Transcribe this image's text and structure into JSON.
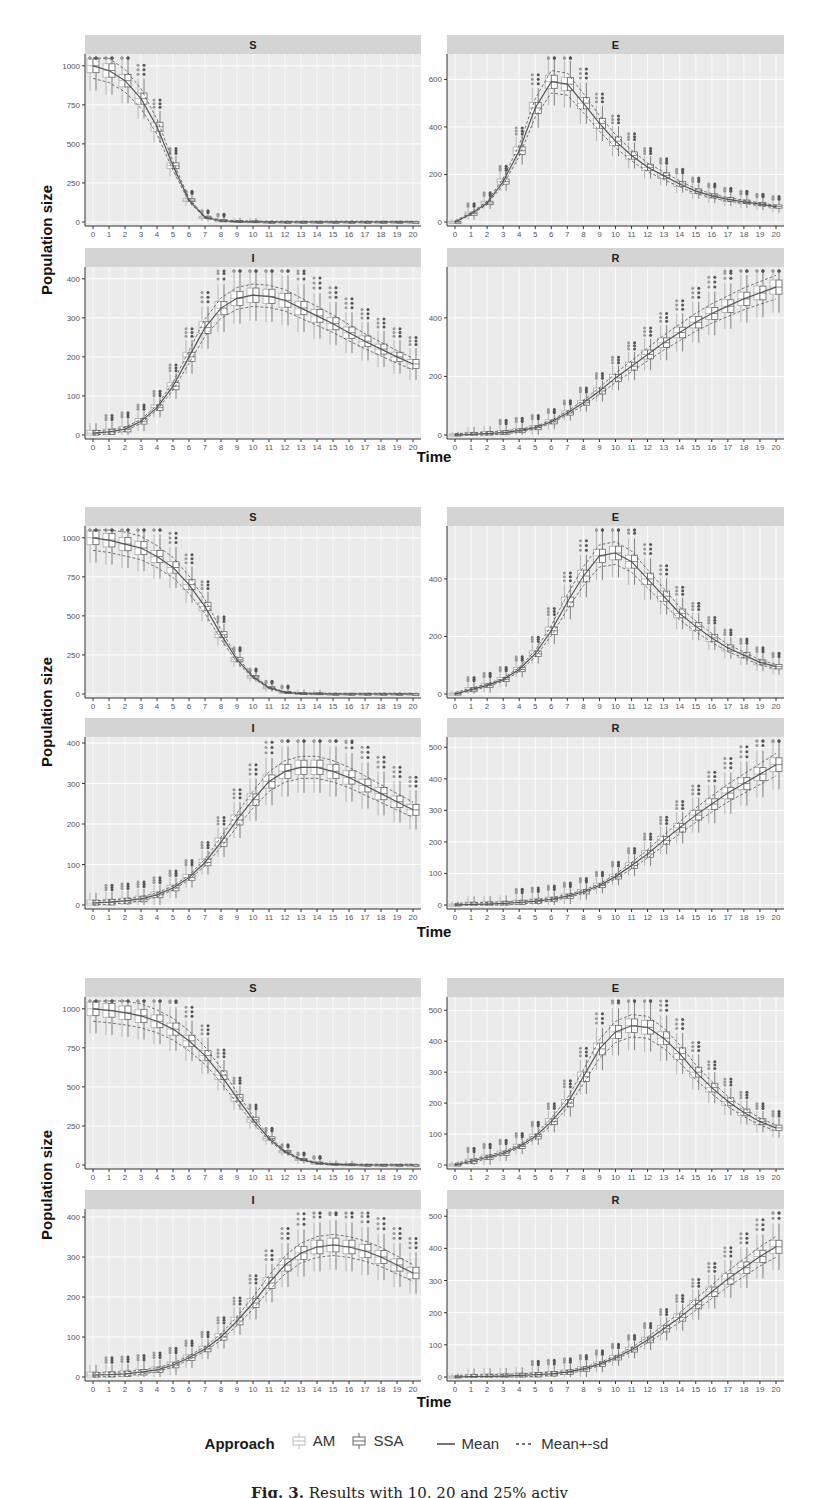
{
  "figure": {
    "y_axis_label": "Population size",
    "x_axis_label": "Time",
    "x_ticks": [
      "0",
      "1",
      "2",
      "3",
      "4",
      "5",
      "6",
      "7",
      "8",
      "9",
      "10",
      "11",
      "12",
      "13",
      "14",
      "15",
      "16",
      "17",
      "18",
      "19",
      "20"
    ]
  },
  "legend": {
    "title": "Approach",
    "items": [
      {
        "label": "AM",
        "symbol": "box-light"
      },
      {
        "label": "SSA",
        "symbol": "box-dark"
      },
      {
        "label": "Mean",
        "symbol": "solid-line"
      },
      {
        "label": "Mean+-sd",
        "symbol": "dashed-line"
      }
    ]
  },
  "caption": {
    "prefix": "Fig. 3.",
    "text": "Results with 10, 20 and 25% activ"
  },
  "colors": {
    "panel_bg": "#ebebeb",
    "strip_bg": "#d4d4d4",
    "grid": "#ffffff",
    "line": "#555555",
    "outlier_am": "#9a9a9a",
    "outlier_ssa": "#555555"
  },
  "chart_data": [
    {
      "type": "box",
      "block": 1,
      "title": "S",
      "xlabel": "Time",
      "ylabel": "Population size",
      "ylim": [
        0,
        1050
      ],
      "yticks": [
        0,
        250,
        500,
        750,
        1000
      ],
      "x": [
        0,
        1,
        2,
        3,
        4,
        5,
        6,
        7,
        8,
        9,
        10,
        11,
        12,
        13,
        14,
        15,
        16,
        17,
        18,
        19,
        20
      ],
      "series": [
        {
          "name": "Mean",
          "values": [
            1000,
            970,
            905,
            790,
            610,
            360,
            140,
            30,
            8,
            3,
            1,
            0,
            0,
            0,
            0,
            0,
            0,
            0,
            0,
            0,
            0
          ]
        }
      ]
    },
    {
      "type": "box",
      "block": 1,
      "title": "E",
      "ylim": [
        0,
        690
      ],
      "yticks": [
        0,
        200,
        400,
        600
      ],
      "x": [
        0,
        1,
        2,
        3,
        4,
        5,
        6,
        7,
        8,
        9,
        10,
        11,
        12,
        13,
        14,
        15,
        16,
        17,
        18,
        19,
        20
      ],
      "series": [
        {
          "name": "Mean",
          "values": [
            0,
            35,
            80,
            170,
            300,
            480,
            590,
            580,
            500,
            415,
            340,
            280,
            230,
            195,
            160,
            130,
            110,
            95,
            85,
            75,
            65
          ]
        }
      ]
    },
    {
      "type": "box",
      "block": 1,
      "title": "I",
      "ylim": [
        0,
        420
      ],
      "yticks": [
        0,
        100,
        200,
        300,
        400
      ],
      "x": [
        0,
        1,
        2,
        3,
        4,
        5,
        6,
        7,
        8,
        9,
        10,
        11,
        12,
        13,
        14,
        15,
        16,
        17,
        18,
        19,
        20
      ],
      "series": [
        {
          "name": "Mean",
          "values": [
            5,
            8,
            15,
            35,
            70,
            125,
            200,
            275,
            325,
            350,
            358,
            355,
            345,
            325,
            305,
            285,
            262,
            240,
            220,
            200,
            182
          ]
        }
      ]
    },
    {
      "type": "box",
      "block": 1,
      "title": "R",
      "ylim": [
        0,
        560
      ],
      "yticks": [
        0,
        200,
        400
      ],
      "x": [
        0,
        1,
        2,
        3,
        4,
        5,
        6,
        7,
        8,
        9,
        10,
        11,
        12,
        13,
        14,
        15,
        16,
        17,
        18,
        19,
        20
      ],
      "series": [
        {
          "name": "Mean",
          "values": [
            0,
            2,
            5,
            8,
            15,
            25,
            45,
            75,
            110,
            150,
            195,
            235,
            275,
            315,
            350,
            385,
            415,
            440,
            465,
            485,
            505
          ]
        }
      ]
    },
    {
      "type": "box",
      "block": 2,
      "title": "S",
      "ylim": [
        0,
        1050
      ],
      "yticks": [
        0,
        250,
        500,
        750,
        1000
      ],
      "x": [
        0,
        1,
        2,
        3,
        4,
        5,
        6,
        7,
        8,
        9,
        10,
        11,
        12,
        13,
        14,
        15,
        16,
        17,
        18,
        19,
        20
      ],
      "series": [
        {
          "name": "Mean",
          "values": [
            1000,
            985,
            960,
            935,
            880,
            810,
            700,
            560,
            380,
            220,
            110,
            40,
            10,
            3,
            1,
            0,
            0,
            0,
            0,
            0,
            0
          ]
        }
      ]
    },
    {
      "type": "box",
      "block": 2,
      "title": "E",
      "ylim": [
        0,
        570
      ],
      "yticks": [
        0,
        200,
        400
      ],
      "x": [
        0,
        1,
        2,
        3,
        4,
        5,
        6,
        7,
        8,
        9,
        10,
        11,
        12,
        13,
        14,
        15,
        16,
        17,
        18,
        19,
        20
      ],
      "series": [
        {
          "name": "Mean",
          "values": [
            0,
            15,
            30,
            50,
            85,
            140,
            220,
            320,
            410,
            480,
            490,
            460,
            400,
            340,
            280,
            235,
            195,
            160,
            135,
            110,
            95
          ]
        }
      ]
    },
    {
      "type": "box",
      "block": 2,
      "title": "I",
      "ylim": [
        0,
        405
      ],
      "yticks": [
        0,
        100,
        200,
        300,
        400
      ],
      "x": [
        0,
        1,
        2,
        3,
        4,
        5,
        6,
        7,
        8,
        9,
        10,
        11,
        12,
        13,
        14,
        15,
        16,
        17,
        18,
        19,
        20
      ],
      "series": [
        {
          "name": "Mean",
          "values": [
            5,
            7,
            10,
            15,
            25,
            42,
            68,
            105,
            155,
            210,
            260,
            305,
            330,
            340,
            340,
            330,
            315,
            295,
            275,
            255,
            235
          ]
        }
      ]
    },
    {
      "type": "box",
      "block": 2,
      "title": "R",
      "ylim": [
        0,
        520
      ],
      "yticks": [
        0,
        100,
        200,
        300,
        400,
        500
      ],
      "x": [
        0,
        1,
        2,
        3,
        4,
        5,
        6,
        7,
        8,
        9,
        10,
        11,
        12,
        13,
        14,
        15,
        16,
        17,
        18,
        19,
        20
      ],
      "series": [
        {
          "name": "Mean",
          "values": [
            0,
            2,
            3,
            5,
            8,
            12,
            18,
            28,
            42,
            62,
            90,
            125,
            162,
            205,
            245,
            285,
            320,
            355,
            385,
            415,
            445
          ]
        }
      ]
    },
    {
      "type": "box",
      "block": 3,
      "title": "S",
      "ylim": [
        0,
        1050
      ],
      "yticks": [
        0,
        250,
        500,
        750,
        1000
      ],
      "x": [
        0,
        1,
        2,
        3,
        4,
        5,
        6,
        7,
        8,
        9,
        10,
        11,
        12,
        13,
        14,
        15,
        16,
        17,
        18,
        19,
        20
      ],
      "series": [
        {
          "name": "Mean",
          "values": [
            1000,
            990,
            975,
            955,
            920,
            870,
            795,
            700,
            575,
            430,
            290,
            170,
            85,
            35,
            12,
            4,
            1,
            0,
            0,
            0,
            0
          ]
        }
      ]
    },
    {
      "type": "box",
      "block": 3,
      "title": "E",
      "ylim": [
        0,
        530
      ],
      "yticks": [
        0,
        100,
        200,
        300,
        400,
        500
      ],
      "x": [
        0,
        1,
        2,
        3,
        4,
        5,
        6,
        7,
        8,
        9,
        10,
        11,
        12,
        13,
        14,
        15,
        16,
        17,
        18,
        19,
        20
      ],
      "series": [
        {
          "name": "Mean",
          "values": [
            0,
            12,
            25,
            38,
            60,
            92,
            140,
            200,
            285,
            375,
            430,
            450,
            445,
            410,
            360,
            300,
            250,
            205,
            170,
            140,
            120
          ]
        }
      ]
    },
    {
      "type": "box",
      "block": 3,
      "title": "I",
      "ylim": [
        0,
        410
      ],
      "yticks": [
        0,
        100,
        200,
        300,
        400
      ],
      "x": [
        0,
        1,
        2,
        3,
        4,
        5,
        6,
        7,
        8,
        9,
        10,
        11,
        12,
        13,
        14,
        15,
        16,
        17,
        18,
        19,
        20
      ],
      "series": [
        {
          "name": "Mean",
          "values": [
            5,
            6,
            8,
            12,
            18,
            30,
            48,
            70,
            100,
            140,
            185,
            235,
            280,
            310,
            325,
            330,
            325,
            315,
            300,
            280,
            260
          ]
        }
      ]
    },
    {
      "type": "box",
      "block": 3,
      "title": "R",
      "ylim": [
        0,
        510
      ],
      "yticks": [
        0,
        100,
        200,
        300,
        400,
        500
      ],
      "x": [
        0,
        1,
        2,
        3,
        4,
        5,
        6,
        7,
        8,
        9,
        10,
        11,
        12,
        13,
        14,
        15,
        16,
        17,
        18,
        19,
        20
      ],
      "series": [
        {
          "name": "Mean",
          "values": [
            0,
            1,
            2,
            3,
            5,
            7,
            10,
            15,
            25,
            40,
            60,
            85,
            115,
            150,
            185,
            225,
            265,
            305,
            340,
            375,
            405
          ]
        }
      ]
    }
  ]
}
